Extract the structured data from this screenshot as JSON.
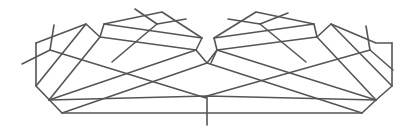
{
  "diagram": {
    "stroke_color": "#555555",
    "background": "#ffffff",
    "width": 413,
    "height": 135,
    "polylines": [
      {
        "name": "left-outer-hull",
        "points": "36,43 36,86 62,113 206,113 362,113 376,100 392,86 392,43"
      },
      {
        "name": "left-top-edge-a",
        "points": "36,43 86,24 100,37"
      },
      {
        "name": "left-top-edge-b",
        "points": "100,37 104,24 162,12 202,38 196,50"
      },
      {
        "name": "right-top-edge-a",
        "points": "317,37 331,24 376,43 392,43"
      },
      {
        "name": "right-top-edge-b",
        "points": "211,63 217,50 214,38 256,12 314,24 317,37"
      },
      {
        "name": "center-valley",
        "points": "196,50 207,63 217,50"
      },
      {
        "name": "center-axis",
        "points": "207,96 207,125"
      },
      {
        "name": "center-v-bottom",
        "points": "49,100 207,96 376,100"
      }
    ],
    "lines": [
      {
        "name": "left-fan-1",
        "x1": 36,
        "y1": 86,
        "x2": 86,
        "y2": 24
      },
      {
        "name": "left-fan-2",
        "x1": 49,
        "y1": 100,
        "x2": 100,
        "y2": 37
      },
      {
        "name": "left-fan-3",
        "x1": 49,
        "y1": 100,
        "x2": 196,
        "y2": 50
      },
      {
        "name": "left-fan-4",
        "x1": 62,
        "y1": 113,
        "x2": 207,
        "y2": 63
      },
      {
        "name": "left-cross-1",
        "x1": 22,
        "y1": 64,
        "x2": 50,
        "y2": 50
      },
      {
        "name": "left-cross-2",
        "x1": 50,
        "y1": 50,
        "x2": 54,
        "y2": 25
      },
      {
        "name": "left-ray-1",
        "x1": 50,
        "y1": 50,
        "x2": 206,
        "y2": 98
      },
      {
        "name": "left-ray-2",
        "x1": 104,
        "y1": 24,
        "x2": 202,
        "y2": 38
      },
      {
        "name": "left-ray-3",
        "x1": 100,
        "y1": 37,
        "x2": 196,
        "y2": 50
      },
      {
        "name": "left-inner-1",
        "x1": 112,
        "y1": 62,
        "x2": 157,
        "y2": 24
      },
      {
        "name": "left-inner-2",
        "x1": 157,
        "y1": 24,
        "x2": 186,
        "y2": 19
      },
      {
        "name": "left-inner-3",
        "x1": 135,
        "y1": 9,
        "x2": 157,
        "y2": 24
      },
      {
        "name": "right-fan-1",
        "x1": 392,
        "y1": 86,
        "x2": 331,
        "y2": 24
      },
      {
        "name": "right-fan-2",
        "x1": 376,
        "y1": 100,
        "x2": 317,
        "y2": 37
      },
      {
        "name": "right-fan-3",
        "x1": 376,
        "y1": 100,
        "x2": 217,
        "y2": 50
      },
      {
        "name": "right-fan-4",
        "x1": 362,
        "y1": 113,
        "x2": 207,
        "y2": 63
      },
      {
        "name": "right-cross-1",
        "x1": 393,
        "y1": 70,
        "x2": 370,
        "y2": 50
      },
      {
        "name": "right-cross-2",
        "x1": 370,
        "y1": 50,
        "x2": 366,
        "y2": 26
      },
      {
        "name": "right-ray-1",
        "x1": 370,
        "y1": 50,
        "x2": 207,
        "y2": 96
      },
      {
        "name": "right-ray-2",
        "x1": 314,
        "y1": 24,
        "x2": 214,
        "y2": 38
      },
      {
        "name": "right-ray-3",
        "x1": 317,
        "y1": 37,
        "x2": 217,
        "y2": 50
      },
      {
        "name": "right-inner-1",
        "x1": 306,
        "y1": 62,
        "x2": 260,
        "y2": 24
      },
      {
        "name": "right-inner-2",
        "x1": 260,
        "y1": 24,
        "x2": 228,
        "y2": 19
      },
      {
        "name": "right-inner-3",
        "x1": 288,
        "y1": 13,
        "x2": 260,
        "y2": 24
      }
    ]
  }
}
